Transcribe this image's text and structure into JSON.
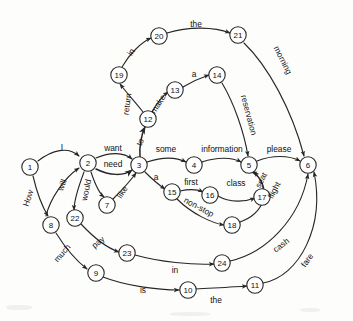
{
  "diagram": {
    "type": "state-transition-network",
    "colors": {
      "background": "#fdfdfc",
      "stroke": "#262626",
      "node_fill": "#ffffff",
      "text": "#101010"
    },
    "nodes": [
      {
        "id": "1",
        "label": "1",
        "x": 30,
        "y": 167
      },
      {
        "id": "2",
        "label": "2",
        "x": 88,
        "y": 163
      },
      {
        "id": "3",
        "label": "3",
        "x": 139,
        "y": 165
      },
      {
        "id": "4",
        "label": "4",
        "x": 194,
        "y": 165
      },
      {
        "id": "5",
        "label": "5",
        "x": 249,
        "y": 165
      },
      {
        "id": "6",
        "label": "6",
        "x": 308,
        "y": 165
      },
      {
        "id": "7",
        "label": "7",
        "x": 107,
        "y": 205
      },
      {
        "id": "8",
        "label": "8",
        "x": 51,
        "y": 225
      },
      {
        "id": "9",
        "label": "9",
        "x": 96,
        "y": 273
      },
      {
        "id": "10",
        "label": "10",
        "x": 188,
        "y": 290
      },
      {
        "id": "11",
        "label": "11",
        "x": 255,
        "y": 285
      },
      {
        "id": "12",
        "label": "12",
        "x": 148,
        "y": 119
      },
      {
        "id": "13",
        "label": "13",
        "x": 175,
        "y": 90
      },
      {
        "id": "14",
        "label": "14",
        "x": 217,
        "y": 75
      },
      {
        "id": "15",
        "label": "15",
        "x": 172,
        "y": 192
      },
      {
        "id": "16",
        "label": "16",
        "x": 210,
        "y": 195
      },
      {
        "id": "17",
        "label": "17",
        "x": 262,
        "y": 197
      },
      {
        "id": "18",
        "label": "18",
        "x": 232,
        "y": 225
      },
      {
        "id": "19",
        "label": "19",
        "x": 119,
        "y": 75
      },
      {
        "id": "20",
        "label": "20",
        "x": 159,
        "y": 36
      },
      {
        "id": "21",
        "label": "21",
        "x": 238,
        "y": 35
      },
      {
        "id": "22",
        "label": "22",
        "x": 75,
        "y": 218
      },
      {
        "id": "23",
        "label": "23",
        "x": 127,
        "y": 253
      },
      {
        "id": "24",
        "label": "24",
        "x": 222,
        "y": 263
      }
    ],
    "edges": [
      {
        "from": "1",
        "to": "2",
        "label": "I",
        "lx": 62,
        "ly": 147,
        "rot": 0
      },
      {
        "from": "1",
        "to": "8",
        "label": "How",
        "lx": 28,
        "ly": 198,
        "rot": -72
      },
      {
        "from": "8",
        "to": "9",
        "label": "much",
        "lx": 62,
        "ly": 253,
        "rot": -50
      },
      {
        "from": "2",
        "to": "3",
        "label": "want",
        "lx": 113,
        "ly": 148,
        "rot": 0
      },
      {
        "from": "2",
        "to": "3",
        "label": "need",
        "lx": 113,
        "ly": 164,
        "rot": 0
      },
      {
        "from": "2",
        "to": "7",
        "label": "would",
        "lx": 86,
        "ly": 190,
        "rot": -78
      },
      {
        "from": "7",
        "to": "3",
        "label": "like",
        "lx": 122,
        "ly": 192,
        "rot": -58
      },
      {
        "from": "8",
        "to": "2",
        "label": "will",
        "lx": 62,
        "ly": 185,
        "rot": -70
      },
      {
        "from": "2",
        "to": "22",
        "label": "pay",
        "lx": 98,
        "ly": 242,
        "rot": -40
      },
      {
        "from": "22",
        "to": "23",
        "label": "",
        "lx": 0,
        "ly": 0,
        "rot": 0
      },
      {
        "from": "3",
        "to": "4",
        "label": "some",
        "lx": 166,
        "ly": 149,
        "rot": 0
      },
      {
        "from": "4",
        "to": "5",
        "label": "information",
        "lx": 222,
        "ly": 149,
        "rot": 0
      },
      {
        "from": "5",
        "to": "6",
        "label": "please",
        "lx": 279,
        "ly": 149,
        "rot": 0
      },
      {
        "from": "3",
        "to": "12",
        "label": "to",
        "lx": 140,
        "ly": 142,
        "rot": -70
      },
      {
        "from": "12",
        "to": "13",
        "label": "make",
        "lx": 158,
        "ly": 104,
        "rot": -58
      },
      {
        "from": "13",
        "to": "14",
        "label": "a",
        "lx": 194,
        "ly": 74,
        "rot": 0
      },
      {
        "from": "14",
        "to": "5",
        "label": "reservation",
        "lx": 249,
        "ly": 115,
        "rot": 75
      },
      {
        "from": "12",
        "to": "19",
        "label": "return",
        "lx": 127,
        "ly": 104,
        "rot": -82
      },
      {
        "from": "19",
        "to": "20",
        "label": "in",
        "lx": 131,
        "ly": 52,
        "rot": -58
      },
      {
        "from": "20",
        "to": "21",
        "label": "the",
        "lx": 196,
        "ly": 24,
        "rot": 0
      },
      {
        "from": "21",
        "to": "6",
        "label": "morning",
        "lx": 283,
        "ly": 60,
        "rot": 63
      },
      {
        "from": "3",
        "to": "15",
        "label": "a",
        "lx": 156,
        "ly": 177,
        "rot": 0
      },
      {
        "from": "15",
        "to": "16",
        "label": "first",
        "lx": 191,
        "ly": 182,
        "rot": 0
      },
      {
        "from": "16",
        "to": "17",
        "label": "class",
        "lx": 236,
        "ly": 183,
        "rot": 0
      },
      {
        "from": "17",
        "to": "5",
        "label": "seat",
        "lx": 261,
        "ly": 180,
        "rot": -62
      },
      {
        "from": "15",
        "to": "18",
        "label": "non-stop",
        "lx": 199,
        "ly": 207,
        "rot": 28
      },
      {
        "from": "18",
        "to": "5",
        "label": "flight",
        "lx": 274,
        "ly": 190,
        "rot": -62
      },
      {
        "from": "23",
        "to": "24",
        "label": "in",
        "lx": 175,
        "ly": 270,
        "rot": 0
      },
      {
        "from": "9",
        "to": "10",
        "label": "is",
        "lx": 143,
        "ly": 290,
        "rot": 0
      },
      {
        "from": "10",
        "to": "11",
        "label": "the",
        "lx": 216,
        "ly": 300,
        "rot": 0
      },
      {
        "from": "24",
        "to": "6",
        "label": "cash",
        "lx": 281,
        "ly": 245,
        "rot": -38
      },
      {
        "from": "11",
        "to": "6",
        "label": "fare",
        "lx": 307,
        "ly": 260,
        "rot": -55
      }
    ],
    "words": [
      "I",
      "How",
      "much",
      "want",
      "need",
      "would",
      "like",
      "will",
      "pay",
      "some",
      "information",
      "please",
      "to",
      "make",
      "a",
      "reservation",
      "return",
      "in",
      "the",
      "morning",
      "first",
      "class",
      "seat",
      "non-stop",
      "flight",
      "is",
      "cash",
      "fare"
    ]
  }
}
